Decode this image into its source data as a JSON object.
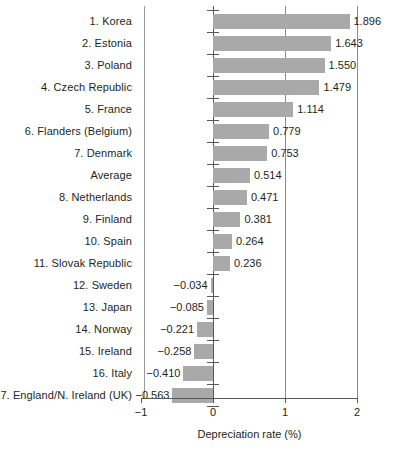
{
  "chart_data": {
    "type": "bar",
    "orientation": "horizontal",
    "title": "",
    "xlabel": "Depreciation rate (%)",
    "ylabel": "",
    "xlim": [
      -1,
      2
    ],
    "xticks": [
      "−1",
      "0",
      "1",
      "2"
    ],
    "xtick_values": [
      -1,
      0,
      1,
      2
    ],
    "grid": true,
    "gridlines_x": [
      0,
      1,
      2
    ],
    "legend": null,
    "bar_color": "#a9a9a9",
    "categories": [
      "1. Korea",
      "2. Estonia",
      "3. Poland",
      "4. Czech Republic",
      "5. France",
      "6. Flanders (Belgium)",
      "7. Denmark",
      "Average",
      "8. Netherlands",
      "9. Finland",
      "10. Spain",
      "11. Slovak Republic",
      "12. Sweden",
      "13. Japan",
      "14. Norway",
      "15. Ireland",
      "16. Italy",
      "17. England/N. Ireland (UK)"
    ],
    "values": [
      1.896,
      1.643,
      1.55,
      1.479,
      1.114,
      0.779,
      0.753,
      0.514,
      0.471,
      0.381,
      0.264,
      0.236,
      -0.034,
      -0.085,
      -0.221,
      -0.258,
      -0.41,
      -0.563
    ],
    "value_labels": [
      "1.896",
      "1.643",
      "1.550",
      "1.479",
      "1.114",
      "0.779",
      "0.753",
      "0.514",
      "0.471",
      "0.381",
      "0.264",
      "0.236",
      "−0.034",
      "−0.085",
      "−0.221",
      "−0.258",
      "−0.410",
      "−0.563"
    ]
  },
  "axis": {
    "xlabel": "Depreciation rate (%)",
    "ticks": [
      {
        "label": "−1",
        "value": -1
      },
      {
        "label": "0",
        "value": 0
      },
      {
        "label": "1",
        "value": 1
      },
      {
        "label": "2",
        "value": 2
      }
    ]
  },
  "rows": [
    {
      "label": "1. Korea",
      "value": 1.896,
      "value_label": "1.896"
    },
    {
      "label": "2. Estonia",
      "value": 1.643,
      "value_label": "1.643"
    },
    {
      "label": "3. Poland",
      "value": 1.55,
      "value_label": "1.550"
    },
    {
      "label": "4. Czech Republic",
      "value": 1.479,
      "value_label": "1.479"
    },
    {
      "label": "5. France",
      "value": 1.114,
      "value_label": "1.114"
    },
    {
      "label": "6. Flanders (Belgium)",
      "value": 0.779,
      "value_label": "0.779"
    },
    {
      "label": "7. Denmark",
      "value": 0.753,
      "value_label": "0.753"
    },
    {
      "label": "Average",
      "value": 0.514,
      "value_label": "0.514"
    },
    {
      "label": "8. Netherlands",
      "value": 0.471,
      "value_label": "0.471"
    },
    {
      "label": "9. Finland",
      "value": 0.381,
      "value_label": "0.381"
    },
    {
      "label": "10. Spain",
      "value": 0.264,
      "value_label": "0.264"
    },
    {
      "label": "11. Slovak Republic",
      "value": 0.236,
      "value_label": "0.236"
    },
    {
      "label": "12. Sweden",
      "value": -0.034,
      "value_label": "−0.034"
    },
    {
      "label": "13. Japan",
      "value": -0.085,
      "value_label": "−0.085"
    },
    {
      "label": "14. Norway",
      "value": -0.221,
      "value_label": "−0.221"
    },
    {
      "label": "15. Ireland",
      "value": -0.258,
      "value_label": "−0.258"
    },
    {
      "label": "16. Italy",
      "value": -0.41,
      "value_label": "−0.410"
    },
    {
      "label": "17. England/N. Ireland (UK)",
      "value": -0.563,
      "value_label": "−0.563"
    }
  ]
}
